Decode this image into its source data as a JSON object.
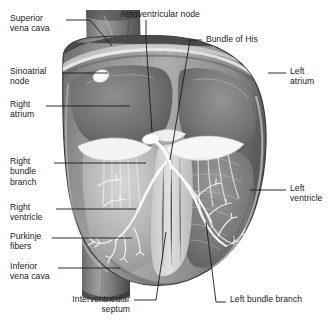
{
  "figure": {
    "width": 330,
    "height": 327,
    "background_color": "#ffffff",
    "text_color": "#1a1a1a",
    "leader_line_color": "#1a1a1a"
  },
  "labels": {
    "superior_vena_cava": "Superior\nvena cava",
    "sinoatrial_node": "Sinoatrial\nnode",
    "right_atrium": "Right\natrium",
    "right_bundle_branch": "Right\nbundle\nbranch",
    "right_ventricle": "Right\nventricle",
    "purkinje_fibers": "Purkinje\nfibers",
    "inferior_vena_cava": "Inferior\nvena cava",
    "atrioventricular_node": "Atrioventricular node",
    "bundle_of_his": "Bundle of His",
    "left_atrium": "Left\natrium",
    "left_ventricle": "Left\nventricle",
    "interventricular_septum": "Interventricular\nseptum",
    "left_bundle_branch": "Left bundle branch"
  },
  "anatomy_colors": {
    "myocardium_dark": "#5f5f5f",
    "myocardium_mid": "#8c8c8c",
    "myocardium_light": "#b8b8b8",
    "chamber_shadow": "#6a6a6a",
    "vessel_gray": "#707070",
    "valve_white": "#f2f2f2",
    "conduction_white": "#fbfbfb",
    "outline": "#3a3a3a"
  }
}
